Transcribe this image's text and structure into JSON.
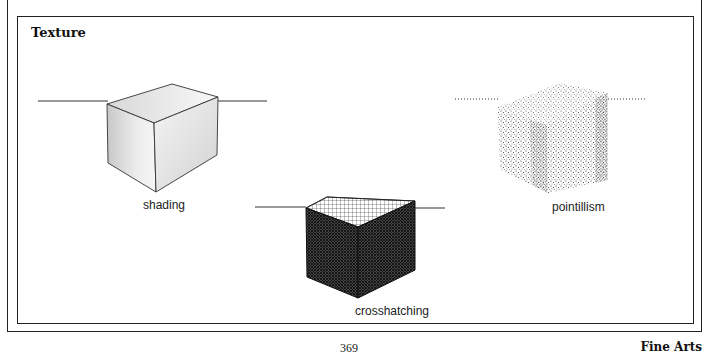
{
  "figure": {
    "title": "Texture",
    "panels": [
      {
        "id": "shading",
        "label": "shading",
        "horizon": "solid"
      },
      {
        "id": "crosshatching",
        "label": "crosshatching",
        "horizon": "solid"
      },
      {
        "id": "pointillism",
        "label": "pointillism",
        "horizon": "dotted"
      }
    ]
  },
  "footer": {
    "page_number": "369",
    "section": "Fine Arts"
  },
  "colors": {
    "ink": "#222222",
    "paper": "#ffffff"
  }
}
